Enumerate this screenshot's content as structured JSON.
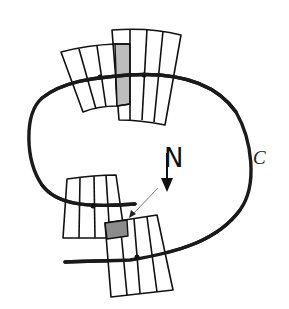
{
  "diagram": {
    "labels": {
      "normal": "N",
      "curve": "C"
    },
    "colors": {
      "stroke": "#111111",
      "curve": "#1a1a1a",
      "highlight_top": "#bdbdbd",
      "highlight_bottom": "#8c8c8c",
      "pointer": "#777777",
      "background": "#ffffff"
    },
    "elements": {
      "curve": "closed curve C",
      "top_left_strip": "strip of 4 cells crossing curve (top-left)",
      "top_right_strip": "strip of 5 cells crossing curve (top-right), first cell shaded",
      "bottom_left_strip": "strip of 4 cells crossing curve (bottom-left)",
      "bottom_right_strip": "strip of 5 cells crossing curve (bottom-right), top-left cell shaded",
      "normal_arrow": "downward arrow labeled N",
      "pointer_line": "thin arrow pointing to shaded cell"
    }
  }
}
